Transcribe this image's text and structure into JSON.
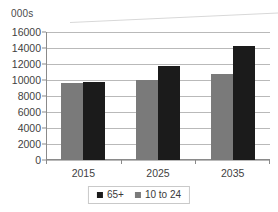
{
  "chart_data": {
    "type": "bar",
    "title": "",
    "subtitle": "",
    "xlabel": "",
    "ylabel": "000s",
    "categories": [
      "2015",
      "2025",
      "2035"
    ],
    "series": [
      {
        "name": "65+",
        "color": "#1b1b1b",
        "values": [
          9700,
          11700,
          14300
        ]
      },
      {
        "name": "10 to 24",
        "color": "#7a7a7a",
        "values": [
          9650,
          10000,
          10700
        ]
      }
    ],
    "series_draw_order": [
      "10 to 24",
      "65+"
    ],
    "ylim": [
      0,
      16000
    ],
    "ytick_step": 2000,
    "yticks": [
      "16000",
      "14000",
      "12000",
      "10000",
      "8000",
      "6000",
      "4000",
      "2000",
      "0"
    ],
    "ytick_values": [
      16000,
      14000,
      12000,
      10000,
      8000,
      6000,
      4000,
      2000,
      0
    ],
    "grid": true,
    "grid_axis": "y",
    "legend_position": "bottom",
    "legend_entries": [
      "65+",
      "10 to 24"
    ],
    "annotations": []
  },
  "axis": {
    "y_title": "000s"
  },
  "legend": {
    "items": [
      {
        "label": "65+",
        "color": "#1b1b1b"
      },
      {
        "label": "10 to 24",
        "color": "#7a7a7a"
      }
    ]
  }
}
